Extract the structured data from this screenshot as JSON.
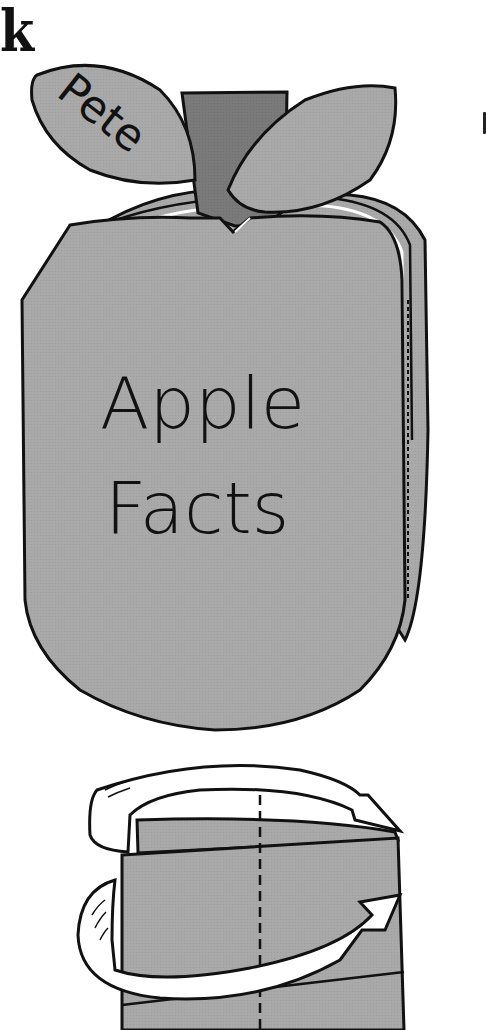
{
  "page": {
    "heading_fragment": "k",
    "colors": {
      "paper": "#ffffff",
      "ink": "#111111",
      "apple_fill": "#a8a8a8",
      "stem_fill": "#7a7a7a",
      "arrow_fill": "#ffffff"
    }
  },
  "apple_book": {
    "leaf_label": "Pete",
    "cover_title_line1": "Apple",
    "cover_title_line2": "Facts"
  },
  "fold_diagram": {
    "description": "Strip folded around, with curved arrows showing wrap direction and a dashed center fold line"
  }
}
